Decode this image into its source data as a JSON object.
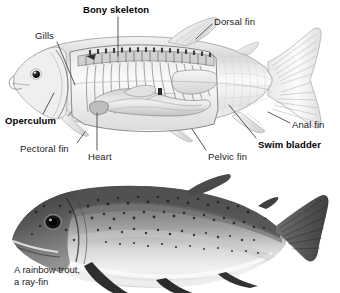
{
  "figure": {
    "title_semantic": "fish-anatomy-and-rainbow-trout-figure",
    "background_color": "#ffffff",
    "text_color": "#1c1c1c",
    "leader_line_color": "#3a3a3a"
  },
  "anatomy_diagram": {
    "name": "cutaway-fish-anatomy-illustration",
    "labels": [
      {
        "id": "bony-skeleton",
        "text": "Bony skeleton",
        "bold": true,
        "x": 83,
        "y": 4,
        "leader": {
          "x1": 118,
          "y1": 17,
          "x2": 118,
          "y2": 56
        }
      },
      {
        "id": "dorsal-fin",
        "text": "Dorsal fin",
        "bold": false,
        "x": 214,
        "y": 16,
        "leader": {
          "x1": 212,
          "y1": 24,
          "x2": 196,
          "y2": 39
        }
      },
      {
        "id": "gills",
        "text": "Gills",
        "bold": false,
        "x": 35,
        "y": 30,
        "leader": {
          "x1": 57,
          "y1": 42,
          "x2": 75,
          "y2": 85
        }
      },
      {
        "id": "operculum",
        "text": "Operculum",
        "bold": true,
        "x": 5,
        "y": 115,
        "leader": {
          "x1": 43,
          "y1": 114,
          "x2": 54,
          "y2": 93
        }
      },
      {
        "id": "pectoral-fin",
        "text": "Pectoral fin",
        "bold": false,
        "x": 20,
        "y": 143,
        "leader": {
          "x1": 77,
          "y1": 143,
          "x2": 85,
          "y2": 132
        }
      },
      {
        "id": "heart",
        "text": "Heart",
        "bold": false,
        "x": 88,
        "y": 151,
        "leader": {
          "x1": 97,
          "y1": 150,
          "x2": 97,
          "y2": 113
        }
      },
      {
        "id": "pelvic-fin",
        "text": "Pelvic fin",
        "bold": false,
        "x": 208,
        "y": 151,
        "leader": {
          "x1": 206,
          "y1": 150,
          "x2": 192,
          "y2": 129
        }
      },
      {
        "id": "swim-bladder",
        "text": "Swim bladder",
        "bold": true,
        "x": 258,
        "y": 139,
        "leader": {
          "x1": 256,
          "y1": 138,
          "x2": 229,
          "y2": 105
        }
      },
      {
        "id": "anal-fin",
        "text": "Anal fin",
        "bold": false,
        "x": 292,
        "y": 119,
        "leader": {
          "x1": 290,
          "y1": 123,
          "x2": 268,
          "y2": 112
        }
      }
    ]
  },
  "photo": {
    "name": "rainbow-trout-photograph",
    "caption_line_1": "A rainbow trout,",
    "caption_line_2": "a ray-fin",
    "caption_x": 14,
    "caption_y_1": 264,
    "caption_y_2": 276
  }
}
